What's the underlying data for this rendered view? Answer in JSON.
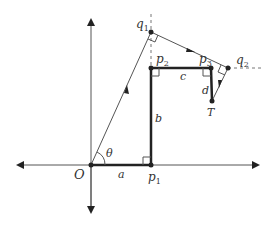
{
  "diagram": {
    "type": "geometric-construction",
    "points": {
      "O": {
        "label": "O",
        "x": 91,
        "y": 165
      },
      "p1": {
        "label": "p",
        "sub": "1",
        "x": 151,
        "y": 165
      },
      "p2": {
        "label": "p",
        "sub": "2",
        "x": 151,
        "y": 68
      },
      "p3": {
        "label": "p",
        "sub": "3",
        "x": 211,
        "y": 68
      },
      "q1": {
        "label": "q",
        "sub": "1",
        "x": 151,
        "y": 32
      },
      "q2": {
        "label": "q",
        "sub": "2",
        "x": 228,
        "y": 68
      },
      "T": {
        "label": "T",
        "x": 212,
        "y": 101
      }
    },
    "segments": {
      "a": "a",
      "b": "b",
      "c": "c",
      "d": "d"
    },
    "angle": "θ",
    "colors": {
      "stroke": "#333333",
      "thin": "#555555",
      "dashed": "#777777"
    }
  }
}
